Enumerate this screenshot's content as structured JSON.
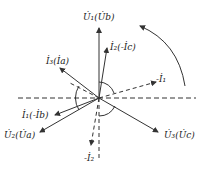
{
  "diagram": {
    "type": "phasor-diagram",
    "center": [
      99,
      98
    ],
    "labels": {
      "U1": "U̇₁(U̇b)",
      "I2": "İ₂(-İc)",
      "I3": "İ₃(İa)",
      "negI1": "-İ₁",
      "I1": "İ₁(-İb)",
      "U2": "U̇₂(U̇a)",
      "U3": "U̇₃(U̇c)",
      "negI2": "-İ₂"
    },
    "rotation_arrow": "counterclockwise",
    "line_color": "#333333"
  }
}
